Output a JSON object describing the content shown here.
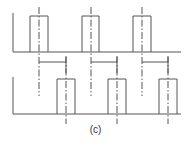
{
  "figure": {
    "caption": "(c)",
    "colors": {
      "stroke": "#555555",
      "background": "#ffffff"
    },
    "top_trace": {
      "baseline_y": 52,
      "axis_x": 13,
      "axis_top_y": 13,
      "x_start": 13,
      "x_end": 181,
      "pulse_top_y": 16,
      "pulses": [
        {
          "x1": 30,
          "x2": 48,
          "center_x": 39
        },
        {
          "x1": 82,
          "x2": 99,
          "center_x": 91
        },
        {
          "x1": 133,
          "x2": 151,
          "center_x": 142
        }
      ],
      "centerline_y1": 7,
      "centerline_y2": 96
    },
    "bottom_trace": {
      "baseline_y": 114,
      "axis_x": 13,
      "axis_top_y": 77,
      "x_start": 13,
      "x_end": 181,
      "pulse_top_y": 79,
      "pulses": [
        {
          "x1": 57,
          "x2": 75,
          "center_x": 66
        },
        {
          "x1": 108,
          "x2": 126,
          "center_x": 117
        },
        {
          "x1": 159,
          "x2": 177,
          "center_x": 168
        }
      ],
      "centerline_y1": 56,
      "centerline_y2": 124
    },
    "delay_brackets": {
      "y": 62,
      "items": [
        {
          "from_x": 39,
          "to_x": 66
        },
        {
          "from_x": 91,
          "to_x": 117
        },
        {
          "from_x": 142,
          "to_x": 168
        }
      ]
    }
  }
}
